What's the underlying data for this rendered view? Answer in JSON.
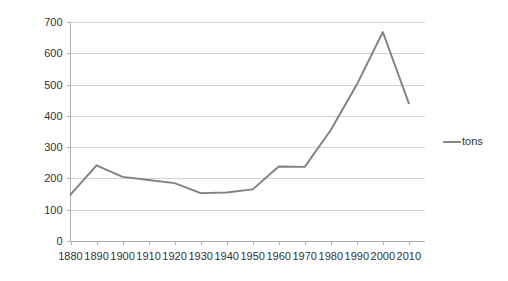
{
  "chart_data": {
    "type": "line",
    "title": "",
    "xlabel": "",
    "ylabel": "",
    "x": [
      1880,
      1890,
      1900,
      1910,
      1920,
      1930,
      1940,
      1950,
      1960,
      1970,
      1980,
      1990,
      2000,
      2010
    ],
    "categories": [
      "1880",
      "1890",
      "1900",
      "1910",
      "1920",
      "1930",
      "1940",
      "1950",
      "1960",
      "1970",
      "1980",
      "1990",
      "2000",
      "2010"
    ],
    "series": [
      {
        "name": "tons",
        "color": "#808080",
        "values": [
          148,
          242,
          205,
          195,
          185,
          153,
          155,
          165,
          238,
          237,
          355,
          500,
          668,
          440
        ]
      }
    ],
    "ylim": [
      0,
      700
    ],
    "yticks": [
      0,
      100,
      200,
      300,
      400,
      500,
      600,
      700
    ],
    "ytick_labels": [
      "0",
      "100",
      "200",
      "300",
      "400",
      "500",
      "600",
      "700"
    ],
    "xtick_labels": [
      "1880",
      "1890",
      "1900",
      "1910",
      "1920",
      "1930",
      "1940",
      "1950",
      "1960",
      "1970",
      "1980",
      "1990",
      "2000",
      "2010"
    ],
    "grid": true,
    "grid_axis": "y",
    "legend": {
      "position": "right",
      "entries": [
        {
          "label": "tons",
          "color": "#808080"
        }
      ]
    }
  },
  "legend": {
    "tons_label": "tons"
  },
  "axis": {
    "y_labels": [
      "700",
      "600",
      "500",
      "400",
      "300",
      "200",
      "100",
      "0"
    ],
    "x_labels": [
      "1880",
      "1890",
      "1900",
      "1910",
      "1920",
      "1930",
      "1940",
      "1950",
      "1960",
      "1970",
      "1980",
      "1990",
      "2000",
      "2010"
    ]
  }
}
